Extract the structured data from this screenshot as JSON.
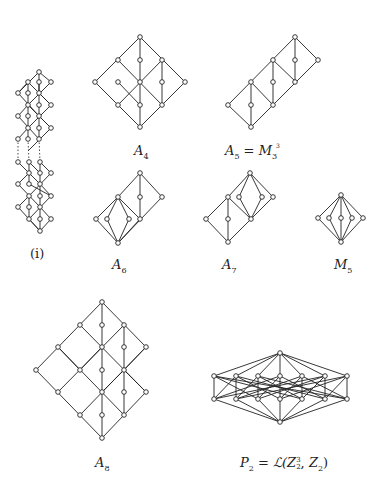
{
  "labels": {
    "chain": "(i)",
    "A4": {
      "base": "A",
      "sub": "4"
    },
    "A5": {
      "lhs_base": "A",
      "lhs_sub": "5",
      "eq": " = ",
      "rhs_base": "M",
      "rhs_sub": "3",
      "rhs_sup": "3"
    },
    "A6": {
      "base": "A",
      "sub": "6"
    },
    "A7": {
      "base": "A",
      "sub": "7"
    },
    "M5": {
      "base": "M",
      "sub": "5"
    },
    "A8": {
      "base": "A",
      "sub": "8"
    },
    "P2": {
      "lhs_base": "P",
      "lhs_sub": "2",
      "eq": " = ",
      "fn": "ℒ(",
      "z1_base": "Z",
      "z1_sup": "3",
      "z1_sub": "2",
      "comma": ", ",
      "z2_base": "Z",
      "z2_sub": "2",
      "close": ")"
    }
  },
  "diagrams": {
    "chain": {
      "nodes": [
        [
          39,
          72
        ],
        [
          28,
          82
        ],
        [
          39,
          82
        ],
        [
          51,
          82
        ],
        [
          18,
          93
        ],
        [
          28,
          93
        ],
        [
          39,
          93
        ],
        [
          28,
          105
        ],
        [
          39,
          105
        ],
        [
          51,
          105
        ],
        [
          18,
          116
        ],
        [
          28,
          116
        ],
        [
          39,
          116
        ],
        [
          28,
          128
        ],
        [
          39,
          128
        ],
        [
          51,
          128
        ],
        [
          18,
          139
        ],
        [
          28,
          139
        ],
        [
          39,
          139
        ],
        [
          18,
          162
        ],
        [
          29,
          162
        ],
        [
          40,
          162
        ],
        [
          29,
          173
        ],
        [
          40,
          173
        ],
        [
          51,
          173
        ],
        [
          18,
          184
        ],
        [
          29,
          184
        ],
        [
          40,
          184
        ],
        [
          29,
          196
        ],
        [
          40,
          196
        ],
        [
          51,
          196
        ],
        [
          18,
          207
        ],
        [
          29,
          207
        ],
        [
          40,
          207
        ],
        [
          29,
          219
        ],
        [
          40,
          219
        ],
        [
          51,
          219
        ],
        [
          40,
          231
        ]
      ]
    },
    "A4": {
      "nodes": [
        [
          140,
          37
        ],
        [
          118,
          60
        ],
        [
          140,
          60
        ],
        [
          162,
          60
        ],
        [
          95,
          82
        ],
        [
          118,
          82
        ],
        [
          140,
          82
        ],
        [
          162,
          82
        ],
        [
          185,
          82
        ],
        [
          118,
          105
        ],
        [
          140,
          105
        ],
        [
          162,
          105
        ],
        [
          140,
          127
        ]
      ]
    },
    "A5": {
      "nodes": [
        [
          295,
          37
        ],
        [
          273,
          60
        ],
        [
          295,
          60
        ],
        [
          318,
          60
        ],
        [
          251,
          82
        ],
        [
          273,
          82
        ],
        [
          295,
          82
        ],
        [
          228,
          105
        ],
        [
          251,
          105
        ],
        [
          273,
          105
        ],
        [
          251,
          127
        ]
      ]
    },
    "A6": {
      "nodes": [
        [
          140,
          173
        ],
        [
          118,
          197
        ],
        [
          140,
          197
        ],
        [
          162,
          197
        ],
        [
          96,
          219
        ],
        [
          107,
          219
        ],
        [
          129,
          219
        ],
        [
          140,
          219
        ],
        [
          118,
          243
        ]
      ]
    },
    "A7": {
      "nodes": [
        [
          250,
          173
        ],
        [
          228,
          197
        ],
        [
          239,
          197
        ],
        [
          262,
          197
        ],
        [
          273,
          197
        ],
        [
          206,
          219
        ],
        [
          228,
          219
        ],
        [
          251,
          219
        ],
        [
          228,
          242
        ]
      ]
    },
    "M5": {
      "nodes": [
        [
          341,
          195
        ],
        [
          318,
          218
        ],
        [
          329,
          218
        ],
        [
          341,
          218
        ],
        [
          352,
          218
        ],
        [
          363,
          218
        ],
        [
          341,
          242
        ]
      ]
    },
    "A8": {
      "nodes": [
        [
          102,
          302
        ],
        [
          80,
          325
        ],
        [
          102,
          325
        ],
        [
          124,
          325
        ],
        [
          58,
          347
        ],
        [
          102,
          347
        ],
        [
          124,
          347
        ],
        [
          146,
          347
        ],
        [
          36,
          370
        ],
        [
          80,
          370
        ],
        [
          102,
          370
        ],
        [
          124,
          370
        ],
        [
          58,
          392
        ],
        [
          102,
          392
        ],
        [
          124,
          392
        ],
        [
          146,
          392
        ],
        [
          80,
          415
        ],
        [
          102,
          415
        ],
        [
          124,
          415
        ],
        [
          102,
          438
        ]
      ]
    },
    "P2": {
      "nodes": [
        [
          280,
          353
        ],
        [
          214,
          376
        ],
        [
          236,
          376
        ],
        [
          258,
          376
        ],
        [
          280,
          376
        ],
        [
          302,
          376
        ],
        [
          325,
          376
        ],
        [
          347,
          376
        ],
        [
          214,
          399
        ],
        [
          236,
          399
        ],
        [
          258,
          399
        ],
        [
          280,
          399
        ],
        [
          302,
          399
        ],
        [
          325,
          399
        ],
        [
          347,
          399
        ],
        [
          280,
          422
        ]
      ]
    }
  }
}
